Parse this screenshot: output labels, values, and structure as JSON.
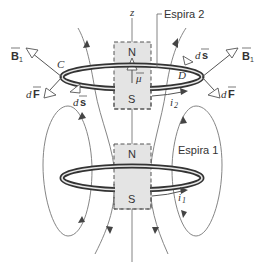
{
  "figure": {
    "type": "physics-diagram",
    "colors": {
      "ring": "#333333",
      "magnet_fill": "#e4e4e4",
      "field_line": "#777777",
      "text": "#333333"
    },
    "labels": {
      "z_axis": "z",
      "loop2": "Espira 2",
      "loop1": "Espira 1",
      "point_c": "C",
      "point_d": "D",
      "mu": "μ",
      "current2": "i",
      "current2_sub": "2",
      "current1": "i",
      "current1_sub": "1",
      "b1_left": "B",
      "b1_left_sub": "1",
      "b1_right": "B",
      "b1_right_sub": "1",
      "df_left_d": "d",
      "df_left_f": "F",
      "df_right_d": "d",
      "df_right_f": "F",
      "ds_left_d": "d",
      "ds_left_s": "s",
      "ds_right_d": "d",
      "ds_right_s": "s"
    },
    "magnets": [
      {
        "name": "magnet-upper",
        "north": "N",
        "south": "S"
      },
      {
        "name": "magnet-lower",
        "north": "N",
        "south": "S"
      }
    ]
  }
}
